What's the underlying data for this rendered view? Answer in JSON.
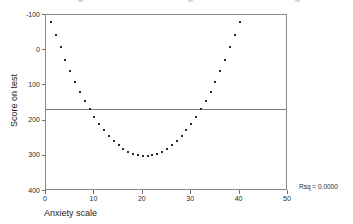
{
  "chart_data": {
    "type": "scatter",
    "title": "",
    "xlabel": "Anxiety scale",
    "ylabel": "Score on test",
    "xlim": [
      0,
      50
    ],
    "ylim": [
      -100,
      400
    ],
    "xticks": [
      0,
      10,
      20,
      30,
      40,
      50
    ],
    "yticks": [
      -100,
      0,
      100,
      200,
      300,
      400
    ],
    "grid": false,
    "legend": null,
    "annotations": [
      {
        "text": "Rsq = 0.0000",
        "position": "bottom-right"
      }
    ],
    "reference_lines": [
      {
        "orientation": "horizontal",
        "y": 133,
        "label": "mean score"
      }
    ],
    "series": [
      {
        "name": "Score on test",
        "marker": "square",
        "color": "#2a2a2a",
        "x": [
          1,
          2,
          3,
          4,
          5,
          6,
          7,
          8,
          9,
          10,
          11,
          12,
          13,
          14,
          15,
          16,
          17,
          18,
          19,
          20,
          21,
          22,
          23,
          24,
          25,
          26,
          27,
          28,
          29,
          30,
          31,
          32,
          33,
          34,
          35,
          36,
          37,
          38,
          39,
          40
        ],
        "y": [
          380,
          343,
          308,
          273,
          241,
          210,
          181,
          155,
          133,
          111,
          91,
          73,
          57,
          43,
          30,
          20,
          12,
          6,
          2,
          0,
          0,
          2,
          6,
          12,
          20,
          30,
          43,
          57,
          73,
          91,
          111,
          133,
          155,
          181,
          210,
          241,
          273,
          308,
          343,
          380
        ]
      }
    ]
  },
  "axes": {
    "y_tick_labels": [
      "400",
      "300",
      "200",
      "100",
      "0",
      "-100"
    ],
    "x_tick_labels": [
      "0",
      "10",
      "20",
      "30",
      "40",
      "50"
    ],
    "y_axis_title": "Score on test",
    "x_axis_title": "Anxiety scale"
  },
  "annotation": {
    "rsq_text": "Rsq = 0.0000"
  },
  "colors": {
    "marker": "#2a2a2a",
    "frame": "#8a8a8a",
    "reference_line": "#7a7a7a",
    "text": "#1a1a1a",
    "background": "#ffffff"
  }
}
